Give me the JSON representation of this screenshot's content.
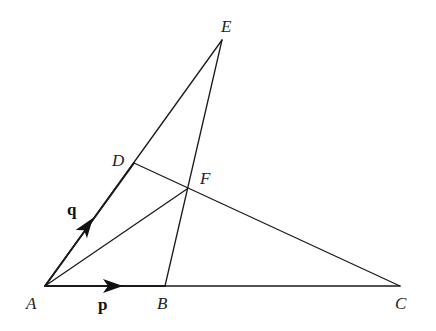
{
  "diagram": {
    "type": "vector-geometry-figure",
    "points": {
      "A": {
        "label": "A",
        "x": 45,
        "y": 286
      },
      "B": {
        "label": "B",
        "x": 165,
        "y": 286
      },
      "C": {
        "label": "C",
        "x": 400,
        "y": 286
      },
      "D": {
        "label": "D",
        "x": 134,
        "y": 163
      },
      "E": {
        "label": "E",
        "x": 222,
        "y": 40
      },
      "F": {
        "label": "F",
        "x": 187,
        "y": 189
      }
    },
    "segments": [
      {
        "from": "A",
        "to": "C",
        "name": "line-AC"
      },
      {
        "from": "A",
        "to": "E",
        "name": "line-AE"
      },
      {
        "from": "E",
        "to": "B",
        "name": "line-EB"
      },
      {
        "from": "D",
        "to": "C",
        "name": "line-DC"
      },
      {
        "from": "A",
        "to": "F",
        "name": "line-AF"
      }
    ],
    "vectors": [
      {
        "label": "p",
        "from": "A",
        "to": "B",
        "description": "vector p along AB"
      },
      {
        "label": "q",
        "from": "A",
        "to": "D",
        "description": "vector q along AD"
      }
    ],
    "labels": {
      "A": "A",
      "B": "B",
      "C": "C",
      "D": "D",
      "E": "E",
      "F": "F",
      "p": "p",
      "q": "q"
    },
    "colors": {
      "line": "#1a1a1a",
      "background": "#ffffff"
    }
  }
}
